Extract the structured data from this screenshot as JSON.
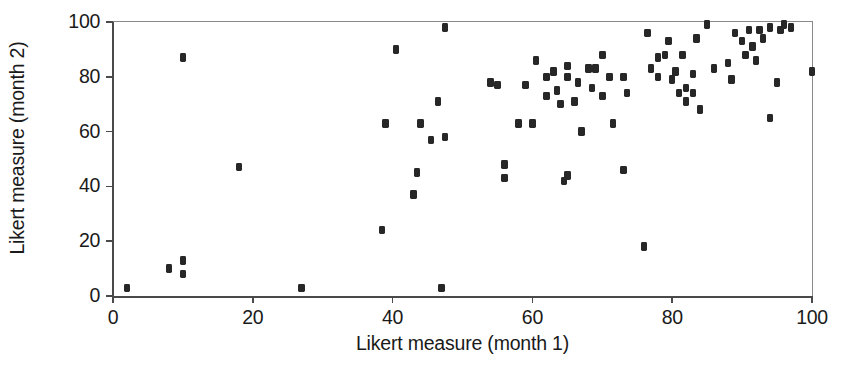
{
  "chart_data": {
    "type": "scatter",
    "title": "",
    "xlabel": "Likert measure (month 1)",
    "ylabel": "Likert measure (month 2)",
    "xlim": [
      0,
      100
    ],
    "ylim": [
      0,
      100
    ],
    "xticks": [
      0,
      20,
      40,
      60,
      80,
      100
    ],
    "yticks": [
      0,
      20,
      40,
      60,
      80,
      100
    ],
    "xticklabels": [
      "0",
      "20",
      "40",
      "60",
      "80",
      "100"
    ],
    "yticklabels": [
      "0",
      "20",
      "40",
      "60",
      "80",
      "100"
    ],
    "grid": false,
    "legend": null,
    "marker": "square",
    "marker_color": "#272727",
    "axis_color": "#4a4a4a",
    "background": "#ffffff",
    "n_points": 84,
    "points": [
      [
        2,
        3
      ],
      [
        8,
        10
      ],
      [
        10,
        8
      ],
      [
        10,
        13
      ],
      [
        10,
        87
      ],
      [
        18,
        47
      ],
      [
        27,
        3
      ],
      [
        38.5,
        24
      ],
      [
        39,
        63
      ],
      [
        40.5,
        90
      ],
      [
        43,
        37
      ],
      [
        43.5,
        45
      ],
      [
        44,
        63
      ],
      [
        45.5,
        57
      ],
      [
        46.5,
        71
      ],
      [
        47,
        3
      ],
      [
        47.5,
        58
      ],
      [
        47.5,
        98
      ],
      [
        54,
        78
      ],
      [
        55,
        77
      ],
      [
        56,
        43
      ],
      [
        56,
        48
      ],
      [
        58,
        63
      ],
      [
        59,
        77
      ],
      [
        60,
        63
      ],
      [
        60.5,
        86
      ],
      [
        62,
        80
      ],
      [
        62,
        73
      ],
      [
        63,
        82
      ],
      [
        63.5,
        75
      ],
      [
        64,
        70
      ],
      [
        64.5,
        42
      ],
      [
        65,
        80
      ],
      [
        65,
        84
      ],
      [
        65,
        44
      ],
      [
        66,
        71
      ],
      [
        66.5,
        78
      ],
      [
        67,
        60
      ],
      [
        68,
        83
      ],
      [
        68.5,
        76
      ],
      [
        69,
        83
      ],
      [
        70,
        73
      ],
      [
        70,
        88
      ],
      [
        71,
        80
      ],
      [
        71.5,
        63
      ],
      [
        73,
        80
      ],
      [
        73,
        46
      ],
      [
        73.5,
        74
      ],
      [
        76,
        18
      ],
      [
        76.5,
        96
      ],
      [
        77,
        83
      ],
      [
        78,
        87
      ],
      [
        78,
        80
      ],
      [
        79,
        88
      ],
      [
        79.5,
        93
      ],
      [
        80,
        79
      ],
      [
        80.5,
        82
      ],
      [
        81,
        74
      ],
      [
        81.5,
        88
      ],
      [
        82,
        76
      ],
      [
        82,
        71
      ],
      [
        83,
        81
      ],
      [
        83,
        74
      ],
      [
        83.5,
        94
      ],
      [
        84,
        68
      ],
      [
        85,
        99
      ],
      [
        86,
        83
      ],
      [
        88,
        85
      ],
      [
        88.5,
        79
      ],
      [
        89,
        96
      ],
      [
        90,
        93
      ],
      [
        90.5,
        88
      ],
      [
        91,
        97
      ],
      [
        91.5,
        91
      ],
      [
        92,
        86
      ],
      [
        92.5,
        97
      ],
      [
        93,
        94
      ],
      [
        94,
        98
      ],
      [
        94,
        65
      ],
      [
        95,
        78
      ],
      [
        95.5,
        97
      ],
      [
        96,
        99
      ],
      [
        97,
        98
      ],
      [
        100,
        82
      ]
    ]
  }
}
